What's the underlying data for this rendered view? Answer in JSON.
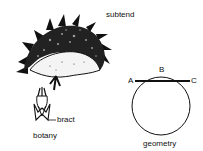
{
  "title": "subtend",
  "botany": {
    "caption": "botany",
    "part_label": "bract"
  },
  "geometry": {
    "caption": "geometry",
    "points": {
      "a": "A",
      "b": "B",
      "c": "C"
    }
  },
  "colors": {
    "ink": "#111111",
    "background": "#ffffff"
  }
}
